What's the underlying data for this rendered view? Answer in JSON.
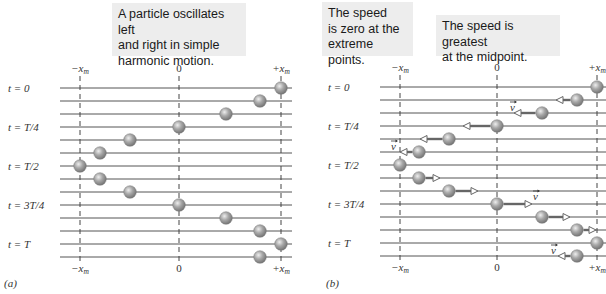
{
  "callouts": [
    {
      "id": "a-osc",
      "lines": [
        "A particle oscillates left",
        "and right in simple",
        "harmonic motion."
      ],
      "x": 112,
      "y": 3,
      "w": 134,
      "h": 53
    },
    {
      "id": "b-zero",
      "lines": [
        "The speed",
        "is zero at the",
        "extreme points."
      ],
      "x": 322,
      "y": 2,
      "w": 91,
      "h": 54
    },
    {
      "id": "b-max",
      "lines": [
        "The speed is greatest",
        "at the midpoint."
      ],
      "x": 436,
      "y": 15,
      "w": 124,
      "h": 41
    }
  ],
  "colors": {
    "line": "#555555",
    "dash": "#444444",
    "ball": "#9a9a9a",
    "ball_highlight": "#e8e8e8",
    "arrow": "#666666",
    "text": "#333333"
  },
  "time_labels": [
    "t = 0",
    "t = T/4",
    "t = T/2",
    "t = 3T/4",
    "t = T"
  ],
  "axis_labels": {
    "neg": "−x",
    "zero": "0",
    "pos": "+x",
    "sub": "m"
  },
  "velocity_label": "v",
  "panels": [
    {
      "id": "a",
      "caption": "(a)",
      "caption_x": 4,
      "caption_y": 287,
      "label_x": 8,
      "line_x0": 60,
      "line_x1": 292,
      "axis_x": {
        "neg": 80,
        "zero": 179,
        "pos": 281
      },
      "rows_y": [
        88,
        101,
        114,
        127,
        140,
        153,
        166,
        179,
        192,
        205,
        218,
        231,
        244,
        257
      ],
      "balls_x": [
        281,
        260,
        226,
        179,
        130,
        100,
        80,
        100,
        130,
        179,
        226,
        260,
        281,
        260
      ],
      "arrows": []
    },
    {
      "id": "b",
      "caption": "(b)",
      "caption_x": 326,
      "caption_y": 287,
      "label_x": 328,
      "line_x0": 380,
      "line_x1": 606,
      "axis_x": {
        "neg": 400,
        "zero": 497,
        "pos": 597
      },
      "rows_y": [
        87,
        100,
        113,
        126,
        139,
        152,
        165,
        178,
        191,
        204,
        217,
        230,
        243,
        256
      ],
      "balls_x": [
        597,
        577,
        542,
        497,
        449,
        419,
        400,
        419,
        449,
        497,
        542,
        577,
        597,
        577
      ],
      "arrows": [
        {
          "row": 1,
          "from": 570,
          "to": 556,
          "label": false
        },
        {
          "row": 2,
          "from": 535,
          "to": 514,
          "label": true,
          "lx": 510,
          "ly": 107
        },
        {
          "row": 3,
          "from": 490,
          "to": 463,
          "label": false
        },
        {
          "row": 4,
          "from": 442,
          "to": 420,
          "label": false
        },
        {
          "row": 5,
          "from": 412,
          "to": 400,
          "label": true,
          "lx": 391,
          "ly": 146
        },
        {
          "row": 7,
          "from": 426,
          "to": 440,
          "label": false
        },
        {
          "row": 8,
          "from": 456,
          "to": 478,
          "label": false
        },
        {
          "row": 9,
          "from": 504,
          "to": 532,
          "label": true,
          "lx": 533,
          "ly": 196
        },
        {
          "row": 10,
          "from": 549,
          "to": 570,
          "label": false
        },
        {
          "row": 11,
          "from": 584,
          "to": 596,
          "label": false
        },
        {
          "row": 13,
          "from": 570,
          "to": 558,
          "label": true,
          "lx": 551,
          "ly": 250
        }
      ]
    }
  ]
}
